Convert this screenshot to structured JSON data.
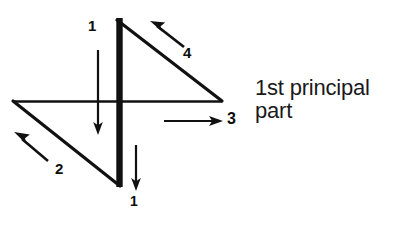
{
  "figure": {
    "title_text": {
      "line1": "1st principal",
      "line2": "part"
    },
    "stroke_color": "#111111",
    "background_color": "#ffffff",
    "labels": [
      {
        "id": "arrow-1-top",
        "text": "1",
        "x": 88,
        "y": 18
      },
      {
        "id": "arrow-4",
        "text": "4",
        "x": 183,
        "y": 45
      },
      {
        "id": "arrow-3",
        "text": "3",
        "x": 227,
        "y": 111
      },
      {
        "id": "arrow-2",
        "text": "2",
        "x": 55,
        "y": 161
      },
      {
        "id": "arrow-1-bottom",
        "text": "1",
        "x": 130,
        "y": 194
      }
    ],
    "shapes": {
      "thick_vertical_bar": {
        "x": 119,
        "y1": 18,
        "y2": 187,
        "width": 6
      },
      "thin_horizontal_bar": {
        "y": 101,
        "x1": 13,
        "x2": 222,
        "width": 2
      },
      "upper_right_hypotenuse": {
        "x1": 118,
        "y1": 19,
        "x2": 222,
        "y2": 101
      },
      "lower_left_hypotenuse": {
        "x1": 13,
        "y1": 101,
        "x2": 119,
        "y2": 186
      }
    },
    "arrows": [
      {
        "id": "arrow-1-top",
        "from_x": 98,
        "from_y": 50,
        "to_x": 98,
        "to_y": 133,
        "direction": "down"
      },
      {
        "id": "arrow-4",
        "from_x": 184,
        "from_y": 46,
        "to_x": 152,
        "to_y": 22,
        "direction": "up-left"
      },
      {
        "id": "arrow-3",
        "from_x": 164,
        "from_y": 121,
        "to_x": 222,
        "to_y": 121,
        "direction": "right"
      },
      {
        "id": "arrow-2",
        "from_x": 48,
        "from_y": 161,
        "to_x": 13,
        "to_y": 132,
        "direction": "up-left"
      },
      {
        "id": "arrow-1-bottom",
        "from_x": 136,
        "from_y": 145,
        "to_x": 136,
        "to_y": 190,
        "direction": "down"
      }
    ]
  }
}
